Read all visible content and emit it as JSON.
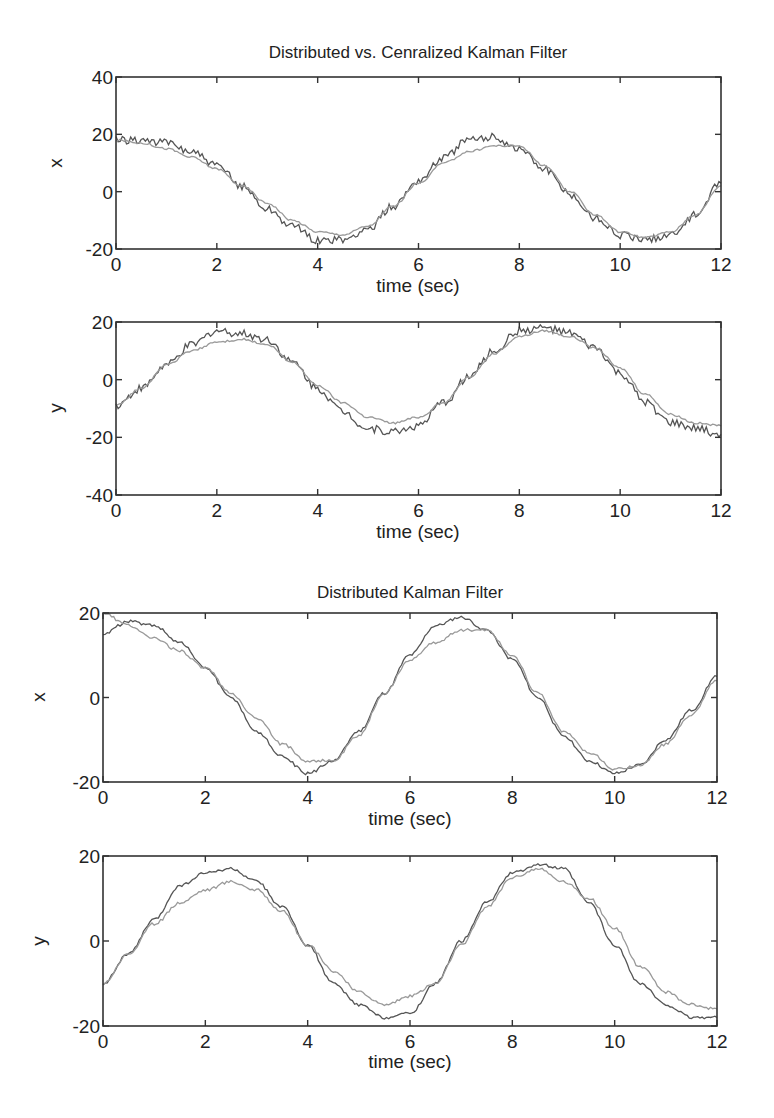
{
  "figure": {
    "width": 774,
    "height": 1118,
    "colors": {
      "series_dark": "#555555",
      "series_light": "#999999",
      "axes": "#333333",
      "background": "#ffffff"
    }
  },
  "chart_data": [
    {
      "type": "line",
      "title": "Distributed vs. Cenralized Kalman Filter",
      "xlabel": "time (sec)",
      "ylabel": "x",
      "xlim": [
        0,
        12
      ],
      "ylim": [
        -20,
        40
      ],
      "xticks": [
        0,
        2,
        4,
        6,
        8,
        10,
        12
      ],
      "yticks": [
        -20,
        0,
        20,
        40
      ],
      "grid": false,
      "legend": null,
      "box": {
        "left": 116,
        "top": 77,
        "right": 721,
        "bottom": 249
      },
      "x": [
        0,
        0.5,
        1,
        1.5,
        2,
        2.5,
        3,
        3.5,
        4,
        4.5,
        5,
        5.5,
        6,
        6.5,
        7,
        7.5,
        8,
        8.5,
        9,
        9.5,
        10,
        10.5,
        11,
        11.5,
        12
      ],
      "series": [
        {
          "name": "noisy estimate",
          "style": "dark",
          "values": [
            18,
            18,
            17,
            14,
            9,
            2,
            -6,
            -12,
            -17,
            -17,
            -13,
            -5,
            4,
            12,
            18,
            19,
            15,
            8,
            -1,
            -9,
            -15,
            -17,
            -15,
            -8,
            3
          ]
        },
        {
          "name": "smooth estimate",
          "style": "light",
          "values": [
            18,
            17,
            15,
            12,
            8,
            2,
            -4,
            -10,
            -14,
            -15,
            -12,
            -5,
            3,
            10,
            14,
            16,
            16,
            9,
            0,
            -8,
            -14,
            -16,
            -14,
            -8,
            2
          ]
        }
      ]
    },
    {
      "type": "line",
      "title": "",
      "xlabel": "time (sec)",
      "ylabel": "y",
      "xlim": [
        0,
        12
      ],
      "ylim": [
        -40,
        20
      ],
      "xticks": [
        0,
        2,
        4,
        6,
        8,
        10,
        12
      ],
      "yticks": [
        -40,
        -20,
        0,
        20
      ],
      "grid": false,
      "legend": null,
      "box": {
        "left": 116,
        "top": 322,
        "right": 721,
        "bottom": 495
      },
      "x": [
        0,
        0.5,
        1,
        1.5,
        2,
        2.5,
        3,
        3.5,
        4,
        4.5,
        5,
        5.5,
        6,
        6.5,
        7,
        7.5,
        8,
        8.5,
        9,
        9.5,
        10,
        10.5,
        11,
        11.5,
        12
      ],
      "series": [
        {
          "name": "noisy estimate",
          "style": "dark",
          "values": [
            -9,
            -3,
            5,
            12,
            17,
            16,
            14,
            6,
            -3,
            -11,
            -17,
            -18,
            -16,
            -8,
            1,
            10,
            17,
            18,
            16,
            11,
            2,
            -8,
            -15,
            -17,
            -19
          ]
        },
        {
          "name": "smooth estimate",
          "style": "light",
          "values": [
            -9,
            -3,
            5,
            10,
            13,
            14,
            12,
            6,
            -2,
            -8,
            -13,
            -15,
            -13,
            -8,
            1,
            9,
            15,
            17,
            15,
            11,
            4,
            -5,
            -12,
            -15,
            -16
          ]
        }
      ]
    },
    {
      "type": "line",
      "title": "Distributed Kalman Filter",
      "xlabel": "time (sec)",
      "ylabel": "x",
      "xlim": [
        0,
        12
      ],
      "ylim": [
        -20,
        20
      ],
      "xticks": [
        0,
        2,
        4,
        6,
        8,
        10,
        12
      ],
      "yticks": [
        -20,
        0,
        20
      ],
      "grid": false,
      "legend": null,
      "box": {
        "left": 103,
        "top": 613,
        "right": 717,
        "bottom": 782
      },
      "x": [
        0,
        0.5,
        1,
        1.5,
        2,
        2.5,
        3,
        3.5,
        4,
        4.5,
        5,
        5.5,
        6,
        6.5,
        7,
        7.5,
        8,
        8.5,
        9,
        9.5,
        10,
        10.5,
        11,
        11.5,
        12
      ],
      "series": [
        {
          "name": "estimate A",
          "style": "dark",
          "values": [
            15,
            18,
            17,
            13,
            7,
            0,
            -8,
            -14,
            -18,
            -15,
            -8,
            1,
            10,
            17,
            19,
            16,
            9,
            0,
            -9,
            -15,
            -18,
            -16,
            -10,
            -3,
            5
          ]
        },
        {
          "name": "estimate B",
          "style": "light",
          "values": [
            20,
            17,
            14,
            11,
            7,
            1,
            -5,
            -11,
            -15,
            -15,
            -9,
            1,
            9,
            13,
            16,
            16,
            10,
            1,
            -8,
            -13,
            -17,
            -16,
            -11,
            -4,
            4
          ]
        }
      ]
    },
    {
      "type": "line",
      "title": "",
      "xlabel": "time (sec)",
      "ylabel": "y",
      "xlim": [
        0,
        12
      ],
      "ylim": [
        -20,
        20
      ],
      "xticks": [
        0,
        2,
        4,
        6,
        8,
        10,
        12
      ],
      "yticks": [
        -20,
        0,
        20
      ],
      "grid": false,
      "legend": null,
      "box": {
        "left": 103,
        "top": 856,
        "right": 717,
        "bottom": 1026
      },
      "x": [
        0,
        0.5,
        1,
        1.5,
        2,
        2.5,
        3,
        3.5,
        4,
        4.5,
        5,
        5.5,
        6,
        6.5,
        7,
        7.5,
        8,
        8.5,
        9,
        9.5,
        10,
        10.5,
        11,
        11.5,
        12
      ],
      "series": [
        {
          "name": "estimate A",
          "style": "dark",
          "values": [
            -10,
            -3,
            5,
            13,
            16,
            17,
            14,
            8,
            -1,
            -10,
            -15,
            -18,
            -17,
            -10,
            0,
            9,
            16,
            18,
            17,
            9,
            -1,
            -10,
            -15,
            -18,
            -18
          ]
        },
        {
          "name": "estimate B",
          "style": "light",
          "values": [
            -10,
            -3,
            4,
            9,
            12,
            14,
            12,
            7,
            -1,
            -7,
            -12,
            -15,
            -13,
            -10,
            -1,
            8,
            15,
            17,
            14,
            10,
            3,
            -6,
            -12,
            -15,
            -16
          ]
        }
      ]
    }
  ]
}
